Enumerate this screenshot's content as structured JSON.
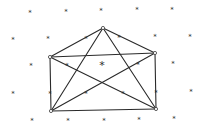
{
  "diagram": {
    "type": "envelope-graph",
    "colors": {
      "line": "#2a2a2a",
      "background": "#ffffff"
    },
    "vertices": [
      {
        "id": "apex",
        "x": 103,
        "y": 28
      },
      {
        "id": "top-left",
        "x": 50,
        "y": 57
      },
      {
        "id": "top-right",
        "x": 155,
        "y": 53
      },
      {
        "id": "bottom-left",
        "x": 51,
        "y": 111
      },
      {
        "id": "bottom-right",
        "x": 156,
        "y": 109
      }
    ],
    "edges": [
      [
        "apex",
        "top-left"
      ],
      [
        "apex",
        "top-right"
      ],
      [
        "top-left",
        "top-right"
      ],
      [
        "top-left",
        "bottom-left"
      ],
      [
        "top-right",
        "bottom-right"
      ],
      [
        "bottom-left",
        "bottom-right"
      ],
      [
        "top-left",
        "bottom-right"
      ],
      [
        "top-right",
        "bottom-left"
      ],
      [
        "apex",
        "bottom-left"
      ],
      [
        "apex",
        "bottom-right"
      ]
    ],
    "marker_glyph": "*",
    "markers": [
      {
        "x": 30,
        "y": 11
      },
      {
        "x": 66,
        "y": 10
      },
      {
        "x": 101,
        "y": 9
      },
      {
        "x": 137,
        "y": 8
      },
      {
        "x": 172,
        "y": 8
      },
      {
        "x": 13,
        "y": 38
      },
      {
        "x": 48,
        "y": 37
      },
      {
        "x": 86,
        "y": 37
      },
      {
        "x": 119,
        "y": 36
      },
      {
        "x": 155,
        "y": 35
      },
      {
        "x": 190,
        "y": 35
      },
      {
        "x": 31,
        "y": 64
      },
      {
        "x": 67,
        "y": 64
      },
      {
        "x": 102,
        "y": 63,
        "big": true
      },
      {
        "x": 138,
        "y": 63
      },
      {
        "x": 173,
        "y": 62
      },
      {
        "x": 13,
        "y": 92
      },
      {
        "x": 50,
        "y": 92
      },
      {
        "x": 86,
        "y": 92
      },
      {
        "x": 123,
        "y": 92
      },
      {
        "x": 156,
        "y": 91
      },
      {
        "x": 191,
        "y": 90
      },
      {
        "x": 32,
        "y": 119
      },
      {
        "x": 68,
        "y": 119
      },
      {
        "x": 104,
        "y": 119
      },
      {
        "x": 139,
        "y": 118
      },
      {
        "x": 174,
        "y": 117
      }
    ]
  }
}
